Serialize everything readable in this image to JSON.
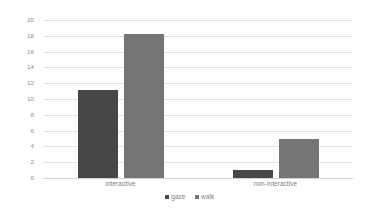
{
  "chart_data": {
    "type": "bar",
    "title": "",
    "xlabel": "",
    "ylabel": "",
    "categories": [
      "interactive",
      "non-interactive"
    ],
    "series": [
      {
        "name": "gaze",
        "values": [
          11.2,
          1.0
        ],
        "color": "#474747"
      },
      {
        "name": "walk",
        "values": [
          18.2,
          4.9
        ],
        "color": "#757575"
      }
    ],
    "ylim": [
      0,
      20
    ],
    "y_ticks": [
      0,
      2,
      4,
      6,
      8,
      10,
      12,
      14,
      16,
      18,
      20
    ],
    "y_tick_labels": [
      "0",
      "2",
      "4",
      "6",
      "8",
      "10",
      "12",
      "14",
      "16",
      "18",
      "20"
    ],
    "grid": true,
    "grid_axis": "y",
    "legend_position": "bottom",
    "legend_entries": [
      "gaze",
      "walk"
    ],
    "annotations": []
  },
  "colors": {
    "gaze": "#474747",
    "walk": "#757575",
    "gridline": "#e3e3e3",
    "baseline": "#d2d2d2",
    "tick_text": "#8c8c8c",
    "label_text": "#7d7d7d",
    "background": "#ffffff"
  }
}
